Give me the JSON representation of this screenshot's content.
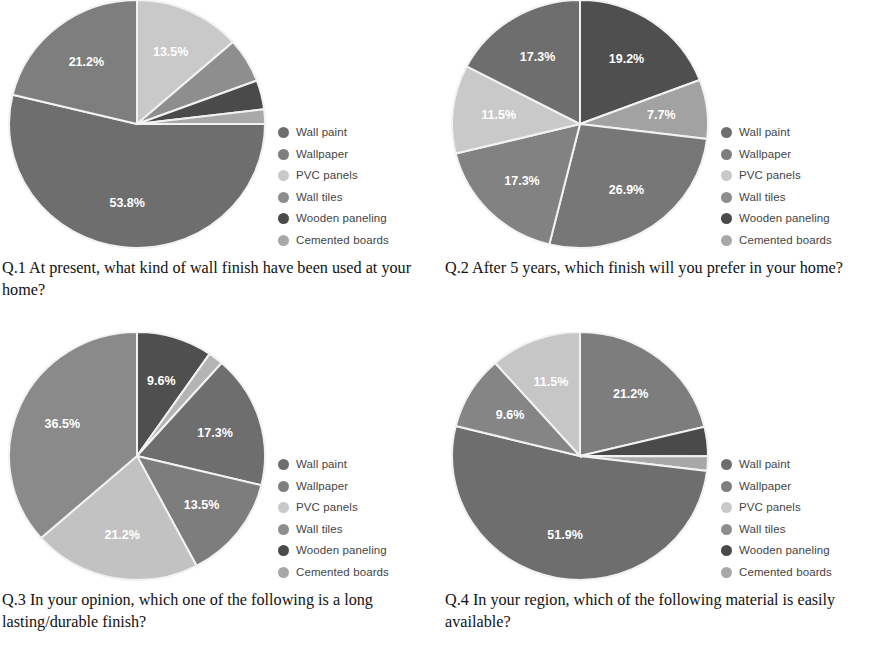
{
  "figure": {
    "series_labels": [
      "Wall paint",
      "Wallpaper",
      "PVC panels",
      "Wall tiles",
      "Wooden paneling",
      "Cemented boards"
    ],
    "series_colors": [
      "#6e6e6e",
      "#7e7e7e",
      "#c9c9c9",
      "#8e8e8e",
      "#4a4a4a",
      "#a8a8a8"
    ],
    "slice_border": "#f2f2f2",
    "label_color": "#ffffff"
  },
  "chart_data": [
    {
      "type": "pie",
      "id": "q1",
      "title": "Q.1 At present, what kind of wall finish have been used at your home?",
      "caption": "Q.1 At present, what kind of wall finish have been used at your home?",
      "categories": [
        "Wall paint",
        "Wallpaper",
        "PVC panels",
        "Wall tiles",
        "Wooden paneling",
        "Cemented boards"
      ],
      "values": [
        53.8,
        21.2,
        13.5,
        5.8,
        3.8,
        1.9
      ],
      "value_labels": [
        "53.8%",
        "21.2%",
        "13.5%",
        "",
        "",
        ""
      ],
      "visible_labels": [
        "13.5%",
        "21.2%",
        "53.8%"
      ],
      "draw_order": [
        "PVC panels",
        "Wall tiles",
        "Wooden paneling",
        "Cemented boards",
        "Wall paint",
        "Wallpaper"
      ],
      "draw_values": [
        13.5,
        5.8,
        3.8,
        1.9,
        53.8,
        21.2
      ],
      "draw_colors": [
        "#c9c9c9",
        "#8e8e8e",
        "#4a4a4a",
        "#a8a8a8",
        "#6e6e6e",
        "#7e7e7e"
      ],
      "draw_label_text": [
        "13.5%",
        "",
        "",
        "",
        "53.8%",
        "21.2%"
      ],
      "start_angle_deg": 0,
      "legend_position": "right",
      "units": "percent"
    },
    {
      "type": "pie",
      "id": "q2",
      "title": "Q.2 After 5 years, which finish will you prefer in your home?",
      "caption": "Q.2 After 5 years, which finish will you prefer in your home?",
      "categories": [
        "Wall paint",
        "Wallpaper",
        "PVC panels",
        "Wall tiles",
        "Wooden paneling",
        "Cemented boards"
      ],
      "values": [
        19.2,
        7.7,
        11.5,
        26.9,
        17.3,
        17.3
      ],
      "value_labels": [
        "19.2%",
        "7.7%",
        "11.5%",
        "26.9%",
        "17.3%",
        "17.3%"
      ],
      "visible_labels": [
        "19.2%",
        "7.7%",
        "26.9%",
        "17.3%",
        "11.5%",
        "17.3%"
      ],
      "draw_order": [
        "Wall paint",
        "Wallpaper",
        "Wall tiles",
        "Wooden paneling",
        "PVC panels",
        "Cemented boards"
      ],
      "draw_values": [
        19.2,
        7.7,
        26.9,
        17.3,
        11.5,
        17.3
      ],
      "draw_colors": [
        "#4f4f4f",
        "#a2a2a2",
        "#777777",
        "#828282",
        "#c9c9c9",
        "#6e6e6e"
      ],
      "draw_label_text": [
        "19.2%",
        "7.7%",
        "26.9%",
        "17.3%",
        "11.5%",
        "17.3%"
      ],
      "start_angle_deg": 0,
      "legend_position": "right",
      "units": "percent"
    },
    {
      "type": "pie",
      "id": "q3",
      "title": "Q.3 In your opinion, which one of the following is a long lasting/durable finish?",
      "caption": "Q.3 In your opinion, which one of the following is a long lasting/durable finish?",
      "categories": [
        "Wall paint",
        "Wallpaper",
        "PVC panels",
        "Wall tiles",
        "Wooden paneling",
        "Cemented boards"
      ],
      "values": [
        9.6,
        13.5,
        21.2,
        17.3,
        36.5,
        1.9
      ],
      "value_labels": [
        "9.6%",
        "13.5%",
        "21.2%",
        "17.3%",
        "36.5%",
        ""
      ],
      "visible_labels": [
        "36.5%",
        "9.6%",
        "17.3%",
        "13.5%",
        "21.2%"
      ],
      "draw_order": [
        "Wall paint",
        "Cemented boards",
        "Wall tiles",
        "Wallpaper",
        "PVC panels",
        "Wooden paneling"
      ],
      "draw_values": [
        9.6,
        1.9,
        17.3,
        13.5,
        21.2,
        36.5
      ],
      "draw_colors": [
        "#4f4f4f",
        "#b4b4b4",
        "#6e6e6e",
        "#7d7d7d",
        "#c2c2c2",
        "#8a8a8a"
      ],
      "draw_label_text": [
        "9.6%",
        "",
        "17.3%",
        "13.5%",
        "21.2%",
        "36.5%"
      ],
      "start_angle_deg": 0,
      "legend_position": "right",
      "units": "percent"
    },
    {
      "type": "pie",
      "id": "q4",
      "title": "Q.4 In your region, which of the following material is easily available?",
      "caption": "Q.4 In your region, which of the following material is easily available?",
      "categories": [
        "Wall paint",
        "Wallpaper",
        "PVC panels",
        "Wall tiles",
        "Wooden paneling",
        "Cemented boards"
      ],
      "values": [
        51.9,
        21.2,
        11.5,
        9.6,
        3.8,
        1.9
      ],
      "value_labels": [
        "51.9%",
        "21.2%",
        "11.5%",
        "9.6%",
        "",
        ""
      ],
      "visible_labels": [
        "21.2%",
        "51.9%",
        "9.6%",
        "11.5%"
      ],
      "draw_order": [
        "Wallpaper",
        "Wooden paneling",
        "Cemented boards",
        "Wall paint",
        "Wall tiles",
        "PVC panels"
      ],
      "draw_values": [
        21.2,
        3.8,
        1.9,
        51.9,
        9.6,
        11.5
      ],
      "draw_colors": [
        "#7d7d7d",
        "#4a4a4a",
        "#a8a8a8",
        "#6e6e6e",
        "#858585",
        "#c6c6c6"
      ],
      "draw_label_text": [
        "21.2%",
        "",
        "",
        "51.9%",
        "9.6%",
        "11.5%"
      ],
      "start_angle_deg": 0,
      "legend_position": "right",
      "units": "percent"
    }
  ],
  "panels": [
    {
      "caption": "Q.1 At present, what kind of wall finish have been used at your home?"
    },
    {
      "caption": "Q.2 After 5 years, which finish will you prefer in your home?"
    },
    {
      "caption": "Q.3 In your opinion, which one of the following is a long lasting/durable finish?"
    },
    {
      "caption": "Q.4 In your region, which of the following material is easily available?"
    }
  ]
}
